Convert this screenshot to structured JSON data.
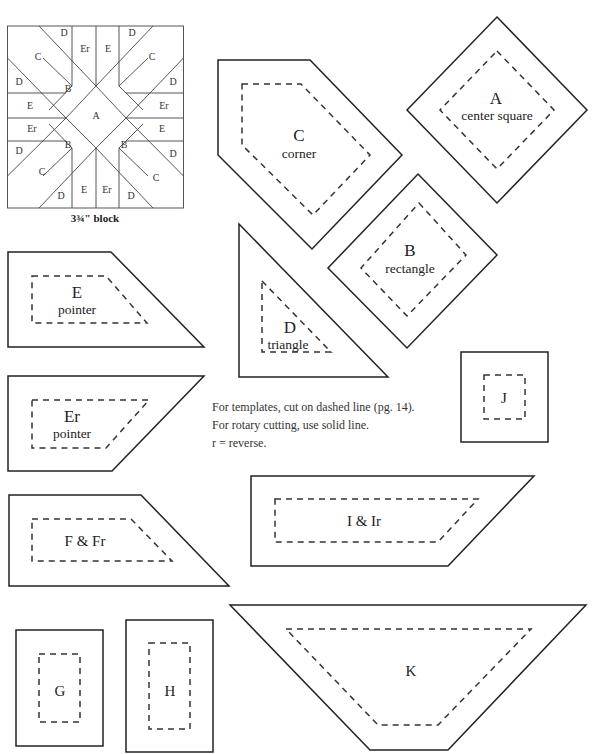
{
  "block": {
    "caption": "3¾\" block",
    "labels": {
      "top_left_C": "C",
      "top_left_D_top": "D",
      "top_left_D_side": "D",
      "top_Er": "Er",
      "top_E": "E",
      "top_right_D_top": "D",
      "top_right_C": "C",
      "top_right_D_side": "D",
      "left_E": "E",
      "left_Er": "Er",
      "right_Er": "Er",
      "right_E": "E",
      "center_A": "A",
      "B_top_left": "B",
      "B_bottom_left": "B",
      "B_bottom_right": "B",
      "bottom_left_D_side": "D",
      "bottom_left_C": "C",
      "bottom_left_D_bottom": "D",
      "bottom_E": "E",
      "bottom_Er": "Er",
      "bottom_right_D_bottom": "D",
      "bottom_right_C": "C",
      "bottom_right_D_side": "D"
    }
  },
  "templates": {
    "A": {
      "letter": "A",
      "name": "center square"
    },
    "B": {
      "letter": "B",
      "name": "rectangle"
    },
    "C": {
      "letter": "C",
      "name": "corner"
    },
    "D": {
      "letter": "D",
      "name": "triangle"
    },
    "E": {
      "letter": "E",
      "name": "pointer"
    },
    "Er": {
      "letter": "Er",
      "name": "pointer"
    },
    "F": {
      "letter": "F & Fr"
    },
    "G": {
      "letter": "G"
    },
    "H": {
      "letter": "H"
    },
    "I": {
      "letter": "I & Ir"
    },
    "J": {
      "letter": "J"
    },
    "K": {
      "letter": "K"
    }
  },
  "notes": [
    "For templates, cut on dashed line (pg. 14).",
    "For rotary cutting, use solid line.",
    "r = reverse."
  ]
}
